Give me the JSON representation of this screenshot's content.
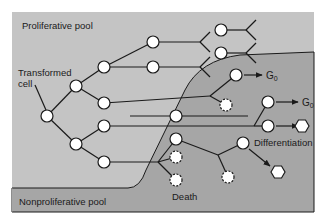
{
  "diagram": {
    "labels": {
      "proliferative_pool": "Proliferative pool",
      "nonproliferative_pool": "Nonproliferative pool",
      "transformed_cell_line1": "Transformed",
      "transformed_cell_line2": "cell",
      "g0_1": "G",
      "g0_1_sub": "0",
      "g0_2": "G",
      "g0_2_sub": "0",
      "differentiation": "Differentiation",
      "death": "Death"
    },
    "colors": {
      "proliferative_bg": "#c4c4c4",
      "nonproliferative_bg": "#a6a6a6",
      "cell_fill": "#ffffff",
      "line": "#1a1a1a"
    }
  }
}
